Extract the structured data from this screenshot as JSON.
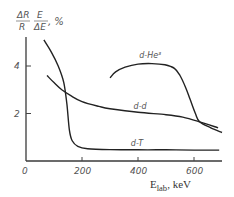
{
  "chart_data": {
    "type": "line",
    "title": "",
    "ylabel": "ΔR/R · E/ΔE, %",
    "ylabel_parts": {
      "frac1_num": "ΔR",
      "frac1_den": "R",
      "frac2_num": "E",
      "frac2_den": "ΔE",
      "unit": ", %"
    },
    "xlabel": "E_lab, keV",
    "xlabel_main": "E",
    "xlabel_sub": "lab",
    "xlabel_unit": ", keV",
    "xlim": [
      0,
      700
    ],
    "ylim": [
      0,
      5.2
    ],
    "x_ticks": [
      0,
      200,
      400,
      600
    ],
    "x_tick_labels": [
      "0",
      "200",
      "400",
      "600"
    ],
    "y_ticks": [
      2,
      4
    ],
    "y_tick_labels": [
      "2",
      "4"
    ],
    "grid": false,
    "legend": "inline labels",
    "series": [
      {
        "name": "d-T",
        "label_pos": [
          410,
          0.62
        ],
        "x": [
          64,
          90,
          115,
          135,
          146,
          155,
          165,
          185,
          220,
          300,
          400,
          500,
          600,
          690
        ],
        "y": [
          5.1,
          4.6,
          4.0,
          3.3,
          2.4,
          1.3,
          0.85,
          0.62,
          0.52,
          0.48,
          0.47,
          0.47,
          0.46,
          0.46
        ]
      },
      {
        "name": "d-d",
        "label_pos": [
          420,
          2.2
        ],
        "x": [
          75,
          100,
          128,
          160,
          200,
          260,
          300,
          400,
          500,
          560,
          620,
          686
        ],
        "y": [
          3.6,
          3.3,
          3.0,
          2.75,
          2.5,
          2.3,
          2.2,
          2.05,
          1.95,
          1.85,
          1.65,
          1.4
        ]
      },
      {
        "name": "d-He³",
        "label_pos": [
          440,
          4.35
        ],
        "x": [
          300,
          320,
          354,
          400,
          450,
          496,
          530,
          550,
          570,
          586,
          605,
          620,
          660,
          700
        ],
        "y": [
          3.5,
          3.75,
          3.95,
          4.08,
          4.1,
          4.05,
          3.9,
          3.6,
          3.1,
          2.6,
          2.0,
          1.65,
          1.4,
          1.2
        ]
      }
    ]
  }
}
